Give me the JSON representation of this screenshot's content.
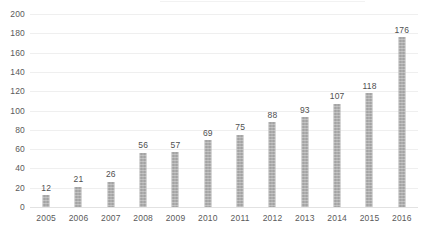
{
  "chart_data": {
    "type": "bar",
    "title": "",
    "subtitle": "",
    "xlabel": "",
    "ylabel": "",
    "categories": [
      "2005",
      "2006",
      "2007",
      "2008",
      "2009",
      "2010",
      "2011",
      "2012",
      "2013",
      "2014",
      "2015",
      "2016"
    ],
    "values": [
      12,
      21,
      26,
      56,
      57,
      69,
      75,
      88,
      93,
      107,
      118,
      176
    ],
    "value_labels": [
      "12",
      "21",
      "26",
      "56",
      "57",
      "69",
      "75",
      "88",
      "93",
      "107",
      "118",
      "176"
    ],
    "ylim": [
      0,
      200
    ],
    "ytick_values": [
      0,
      20,
      40,
      60,
      80,
      100,
      120,
      140,
      160,
      180,
      200
    ],
    "ytick_labels": [
      "0",
      "20",
      "40",
      "60",
      "80",
      "100",
      "120",
      "140",
      "160",
      "180",
      "200"
    ],
    "grid": true,
    "grid_axis": "y",
    "legend": false,
    "legend_position": "none",
    "series": [
      {
        "name": "",
        "values": [
          12,
          21,
          26,
          56,
          57,
          69,
          75,
          88,
          93,
          107,
          118,
          176
        ]
      }
    ],
    "colors": {
      "bar_fill": "#a3a3a3",
      "gridline": "#efefef",
      "baseline": "#e2e2e2",
      "tick_text": "#5a5a5a",
      "value_text": "#4f4f4f",
      "background": "#ffffff"
    }
  }
}
